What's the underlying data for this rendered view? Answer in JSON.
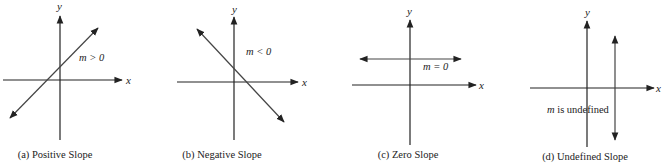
{
  "panels": [
    {
      "id": "a",
      "caption": "(a) Positive Slope",
      "x_label": "x",
      "y_label": "y",
      "annotation": "m > 0",
      "slope_type": "positive"
    },
    {
      "id": "b",
      "caption": "(b) Negative Slope",
      "x_label": "x",
      "y_label": "y",
      "annotation": "m < 0",
      "slope_type": "negative"
    },
    {
      "id": "c",
      "caption": "(c) Zero Slope",
      "x_label": "x",
      "y_label": "y",
      "annotation": "m = 0",
      "slope_type": "zero"
    },
    {
      "id": "d",
      "caption": "(d) Undefined Slope",
      "x_label": "x",
      "y_label": "y",
      "annotation_var": "m",
      "annotation_rest": " is undefined",
      "slope_type": "undefined"
    }
  ],
  "colors": {
    "axis": "#222222",
    "line": "#444444",
    "text": "#222222"
  }
}
